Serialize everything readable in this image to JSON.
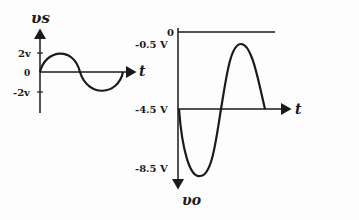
{
  "input_plot": {
    "y_axis_label": "υs",
    "y_axis_subscript": "S",
    "x_axis_label": "t",
    "ticks": {
      "top": "2v",
      "origin": "0",
      "bottom": "-2v"
    },
    "waveform": "sine",
    "amplitude_v": 2
  },
  "output_plot": {
    "y_axis_label": "υo",
    "x_axis_label": "t",
    "ticks": [
      "0",
      "-0.5 V",
      "-4.5 V",
      "-8.5 V"
    ],
    "baseline_v": -4.5,
    "max_v": -0.5,
    "min_v": -8.5,
    "waveform": "inverted sine shifted"
  },
  "colors": {
    "ink": "#1a1a1a",
    "background": "#fdfdfd"
  }
}
